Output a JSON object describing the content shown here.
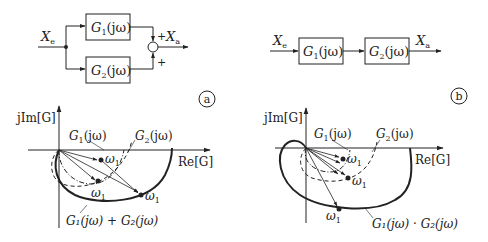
{
  "panel_a": {
    "badge": "a",
    "block_diagram": {
      "input_label": "X",
      "input_sub": "e",
      "output_label": "X",
      "output_sub": "a",
      "block1": {
        "name": "G",
        "sub": "1",
        "arg": "(jω)"
      },
      "block2": {
        "name": "G",
        "sub": "2",
        "arg": "(jω)"
      },
      "sum_sign_top": "+",
      "sum_sign_bottom": "+"
    },
    "plot": {
      "y_axis": "jIm[G]",
      "x_axis": "Re[G]",
      "curve_g1": {
        "name": "G",
        "sub": "1",
        "arg": "(jω)"
      },
      "curve_g2": {
        "name": "G",
        "sub": "2",
        "arg": "(jω)"
      },
      "curve_sum": "G₁(jω) + G₂(jω)",
      "omega_label": "ω",
      "omega_sub": "1"
    }
  },
  "panel_b": {
    "badge": "b",
    "block_diagram": {
      "input_label": "X",
      "input_sub": "e",
      "output_label": "X",
      "output_sub": "a",
      "block1": {
        "name": "G",
        "sub": "1",
        "arg": "(jω)"
      },
      "block2": {
        "name": "G",
        "sub": "2",
        "arg": "(jω)"
      }
    },
    "plot": {
      "y_axis": "jIm[G]",
      "x_axis": "Re[G]",
      "curve_g1": {
        "name": "G",
        "sub": "1",
        "arg": "(jω)"
      },
      "curve_g2": {
        "name": "G",
        "sub": "2",
        "arg": "(jω)"
      },
      "curve_product": "G₁(jω) · G₂(jω)",
      "omega_label": "ω",
      "omega_sub": "1"
    }
  }
}
